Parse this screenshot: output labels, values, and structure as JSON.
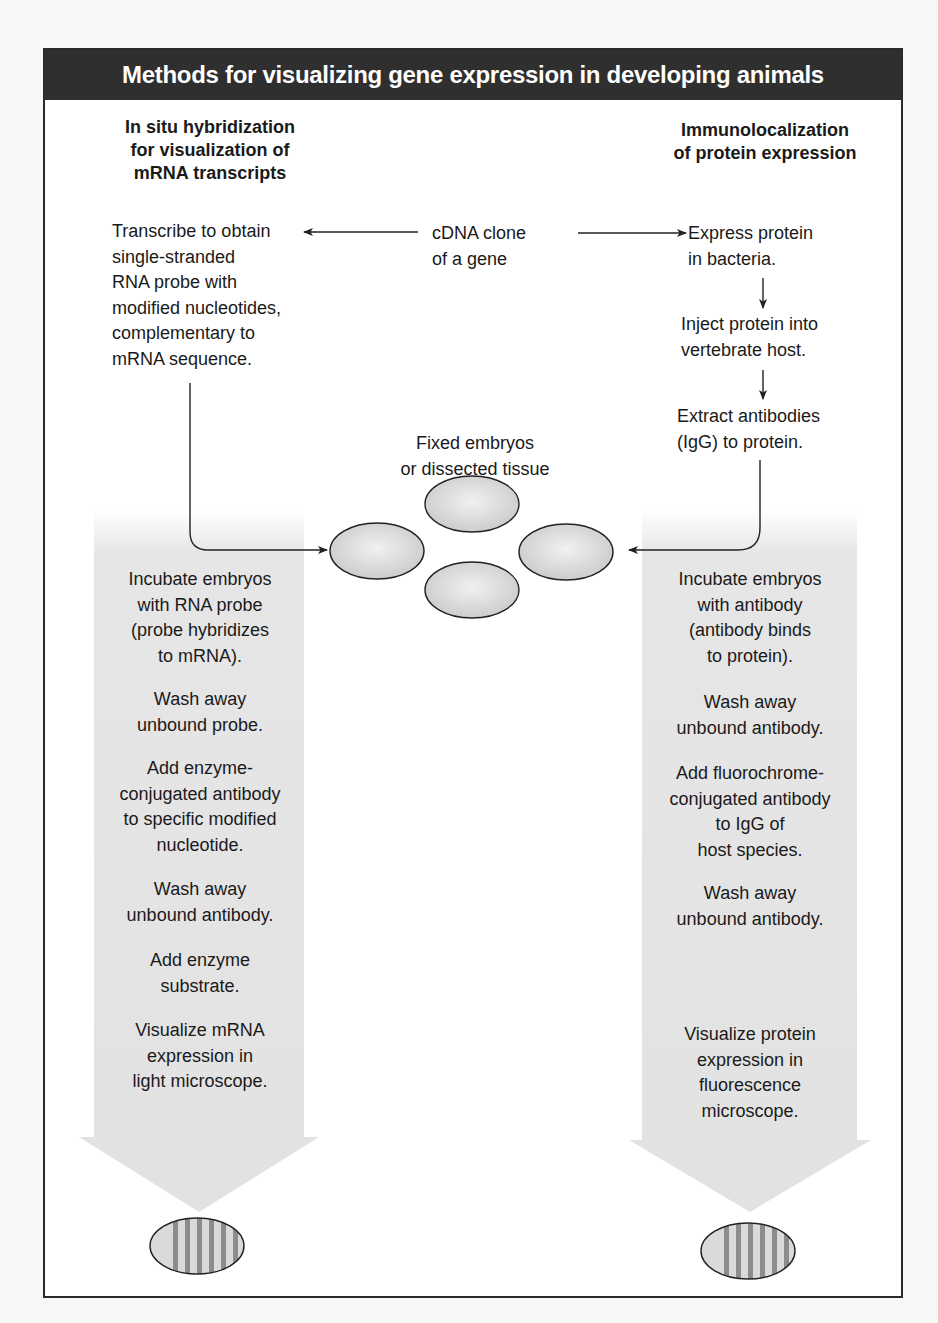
{
  "figure": {
    "title": "Methods for visualizing gene expression in developing animals",
    "colors": {
      "title_bar_bg": "#2f2f2f",
      "title_bar_text": "#ffffff",
      "panel_border": "#2a2a2a",
      "arrow_fill": "#e4e4e4",
      "embryo_fill": "#dcdcdc",
      "stripe_color": "#8c8c8c"
    }
  },
  "left_column": {
    "heading": [
      "In situ hybridization",
      "for visualization of",
      "mRNA transcripts"
    ],
    "first_step": [
      "Transcribe to obtain",
      "single-stranded",
      "RNA probe with",
      "modified nucleotides,",
      "complementary to",
      "mRNA sequence."
    ],
    "steps": [
      {
        "lines": [
          "Incubate embryos",
          "with RNA probe",
          "(probe hybridizes",
          "to mRNA)."
        ]
      },
      {
        "lines": [
          "Wash away",
          "unbound probe."
        ]
      },
      {
        "lines": [
          "Add enzyme-",
          "conjugated antibody",
          "to specific modified",
          "nucleotide."
        ]
      },
      {
        "lines": [
          "Wash away",
          "unbound antibody."
        ]
      },
      {
        "lines": [
          "Add enzyme",
          "substrate."
        ]
      },
      {
        "lines": [
          "Visualize mRNA",
          "expression in",
          "light microscope."
        ]
      }
    ],
    "result_icon": "striped-embryo-icon"
  },
  "center": {
    "source": [
      "cDNA clone",
      "of a gene"
    ],
    "sample_label": [
      "Fixed embryos",
      "or dissected tissue"
    ],
    "sample_count": 4
  },
  "right_column": {
    "heading": [
      "Immunolocalization",
      "of protein expression"
    ],
    "prep_steps": [
      {
        "lines": [
          "Express protein",
          "in bacteria."
        ]
      },
      {
        "lines": [
          "Inject protein into",
          "vertebrate host."
        ]
      },
      {
        "lines": [
          "Extract antibodies",
          "(IgG) to protein."
        ]
      }
    ],
    "steps": [
      {
        "lines": [
          "Incubate embryos",
          "with antibody",
          "(antibody binds",
          "to protein)."
        ]
      },
      {
        "lines": [
          "Wash away",
          "unbound antibody."
        ]
      },
      {
        "lines": [
          "Add fluorochrome-",
          "conjugated antibody",
          "to IgG of",
          "host species."
        ]
      },
      {
        "lines": [
          "Wash away",
          "unbound antibody."
        ]
      },
      {
        "lines": [
          "Visualize protein",
          "expression in",
          "fluorescence",
          "microscope."
        ]
      }
    ],
    "result_icon": "striped-embryo-icon"
  }
}
